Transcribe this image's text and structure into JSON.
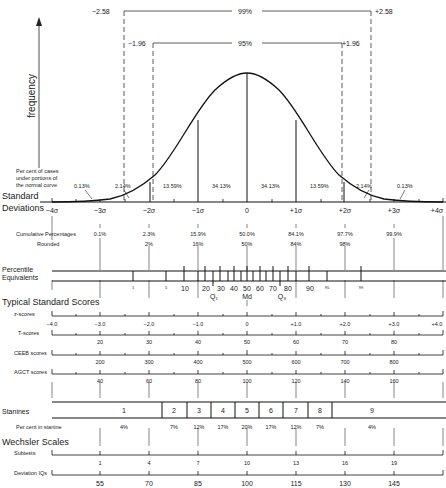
{
  "confidence_intervals": {
    "outer": {
      "left": "−2.58",
      "label": "99%",
      "right": "+2.58"
    },
    "inner": {
      "left": "−1.96",
      "label": "95%",
      "right": "+1.96"
    }
  },
  "y_axis_label": "frequency",
  "curve_note": "Per cent of cases under portions of the normal curve",
  "curve_note_lines": [
    "Per cent of cases",
    "under portions of",
    "the normal curve"
  ],
  "area_percents": [
    "0.13%",
    "2.14%",
    "13.59%",
    "34.13%",
    "34.13%",
    "13.59%",
    "2.14%",
    "0.13%"
  ],
  "standard_deviations": {
    "label_lines": [
      "Standard",
      "Deviations"
    ],
    "ticks": [
      "−4σ",
      "−3σ",
      "−2σ",
      "−1σ",
      "0",
      "+1σ",
      "+2σ",
      "+3σ",
      "+4σ"
    ]
  },
  "cumulative": {
    "label": "Cumulative Percentages",
    "values": [
      "0.1%",
      "2.3%",
      "15.9%",
      "50.0%",
      "84.1%",
      "97.7%",
      "99.9%"
    ],
    "rounded_label": "Rounded",
    "rounded": [
      "2%",
      "16%",
      "50%",
      "84%",
      "98%"
    ]
  },
  "percentile": {
    "label_lines": [
      "Percentile",
      "Equivalents"
    ],
    "small_labels": [
      "1",
      "5",
      "95",
      "99"
    ],
    "labels": [
      "10",
      "20",
      "30",
      "40",
      "50",
      "60",
      "70",
      "80",
      "90"
    ],
    "quartiles": [
      "Q₁",
      "Md",
      "Q₃"
    ]
  },
  "typical_scores": {
    "title": "Typical Standard Scores",
    "z": {
      "label": "z-scores",
      "values": [
        "−4.0",
        "−3.0",
        "−2.0",
        "−1.0",
        "0",
        "+1.0",
        "+2.0",
        "+3.0",
        "+4.0"
      ]
    },
    "t": {
      "label": "T-scores",
      "values": [
        "20",
        "30",
        "40",
        "50",
        "60",
        "70",
        "80"
      ]
    },
    "ceeb": {
      "label": "CEEB scores",
      "values": [
        "200",
        "300",
        "400",
        "500",
        "600",
        "700",
        "800"
      ]
    },
    "agct": {
      "label": "AGCT scores",
      "values": [
        "40",
        "60",
        "80",
        "100",
        "120",
        "140",
        "160"
      ]
    }
  },
  "stanines": {
    "label": "Stanines",
    "values": [
      "1",
      "2",
      "3",
      "4",
      "5",
      "6",
      "7",
      "8",
      "9"
    ],
    "percent_label": "Per cent in stanine",
    "percents": [
      "4%",
      "7%",
      "12%",
      "17%",
      "20%",
      "17%",
      "12%",
      "7%",
      "4%"
    ]
  },
  "wechsler": {
    "title": "Wechsler Scales",
    "subtests": {
      "label": "Subtests",
      "values": [
        "1",
        "4",
        "7",
        "10",
        "13",
        "16",
        "19"
      ]
    },
    "iq": {
      "label": "Deviation IQs",
      "values": [
        "55",
        "70",
        "85",
        "100",
        "115",
        "130",
        "145"
      ]
    }
  }
}
